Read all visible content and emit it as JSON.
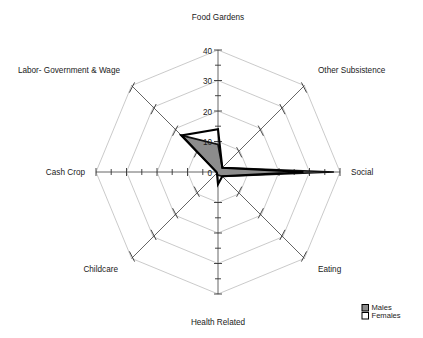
{
  "chart_data": {
    "type": "radar",
    "title": "",
    "categories": [
      "Food Gardens",
      "Other Subsistence",
      "Social",
      "Eating",
      "Health Related",
      "Childcare",
      "Cash Crop",
      "Labor- Government & Wage"
    ],
    "series": [
      {
        "name": "Males",
        "values": [
          9,
          2,
          38,
          2,
          1,
          0.5,
          0.5,
          17
        ],
        "color": "#8c8c8c"
      },
      {
        "name": "Females",
        "values": [
          14,
          2,
          28,
          2,
          4,
          0.5,
          0.5,
          17
        ],
        "color": "#ffffff"
      }
    ],
    "tick_values": [
      0,
      10,
      20,
      30,
      40
    ],
    "tick_labels": [
      "0",
      "10",
      "20",
      "30",
      "40"
    ],
    "rlim": [
      0,
      40
    ],
    "grid": true,
    "legend_position": "bottom-right",
    "xlabel": "",
    "ylabel": ""
  },
  "axis_labels": {
    "food_gardens": "Food Gardens",
    "other_subsistence": "Other Subsistence",
    "social": "Social",
    "eating": "Eating",
    "health_related": "Health Related",
    "childcare": "Childcare",
    "cash_crop": "Cash Crop",
    "labor_government_wage": "Labor- Government & Wage"
  },
  "radial_ticks": {
    "t0": "0",
    "t10": "10",
    "t20": "20",
    "t30": "30",
    "t40": "40"
  },
  "legend": {
    "males_label": "Males",
    "females_label": "Females"
  }
}
